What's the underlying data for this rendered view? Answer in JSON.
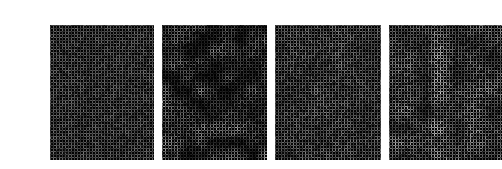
{
  "figure": {
    "background_color": "#ffffff",
    "panel_count": 4,
    "panel_top": 9,
    "panel_height": 135,
    "caption_top": 148,
    "caption_color": "#1a1a1a",
    "caption_font_size": 9
  },
  "panels": [
    {
      "id": "panel-a",
      "caption": "(가)",
      "x": 10,
      "y": 9,
      "width": 104,
      "height": 135,
      "background_color": "#000000",
      "mesh_color": "#8a8a8a",
      "texture": "uniform-fine-mesh",
      "cell_period": 3,
      "line_width": 1,
      "mean_brightness": 46,
      "contrast": 0.55,
      "blotch_scale": 0,
      "blotch_strength": 0.18,
      "vertical_streak": 0.0,
      "seed": 10117
    },
    {
      "id": "panel-b",
      "caption": "(나)",
      "x": 122,
      "y": 9,
      "width": 105,
      "height": 135,
      "background_color": "#000000",
      "mesh_color": "#9a9a9a",
      "texture": "mottled-mesh-with-voids",
      "cell_period": 3,
      "line_width": 1,
      "mean_brightness": 38,
      "contrast": 0.95,
      "blotch_scale": 13,
      "blotch_strength": 0.85,
      "vertical_streak": 0.0,
      "seed": 20483
    },
    {
      "id": "panel-c",
      "caption": "(다)",
      "x": 235,
      "y": 9,
      "width": 106,
      "height": 135,
      "background_color": "#000000",
      "mesh_color": "#8f8f8f",
      "texture": "uniform-fine-mesh",
      "cell_period": 3,
      "line_width": 1,
      "mean_brightness": 48,
      "contrast": 0.6,
      "blotch_scale": 22,
      "blotch_strength": 0.22,
      "vertical_streak": 0.0,
      "seed": 30971
    },
    {
      "id": "panel-d",
      "caption": "(라)",
      "x": 349,
      "y": 9,
      "width": 113,
      "height": 135,
      "background_color": "#000000",
      "mesh_color": "#969696",
      "texture": "mesh-with-vertical-streaks",
      "cell_period": 3,
      "line_width": 1,
      "mean_brightness": 50,
      "contrast": 0.7,
      "blotch_scale": 17,
      "blotch_strength": 0.45,
      "vertical_streak": 0.55,
      "seed": 41237
    }
  ]
}
